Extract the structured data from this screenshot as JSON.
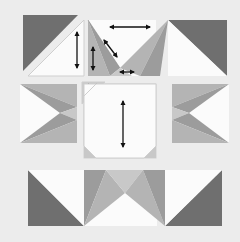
{
  "diagram": {
    "type": "quilt-block-puzzle",
    "colors": {
      "background": "#ececec",
      "dark": "#6f6f6f",
      "medium": "#9c9c9c",
      "medium_light": "#b4b4b4",
      "light": "#c8c8c8",
      "white": "#fbfbfb",
      "outline": "#cfcfcf",
      "arrow": "#111111"
    },
    "pieces": {
      "top_left": "half-square triangle (dark / white)",
      "top_middle": "flying geese unit with arrows",
      "top_right": "half-square triangle (dark / white)",
      "middle_left": "flying geese unit (rotated)",
      "center": "octagon square with corner triangles",
      "middle_right": "flying geese unit (rotated)",
      "bottom_left": "half-square triangle (dark / white)",
      "bottom_middle": "flying geese unit",
      "bottom_right": "half-square triangle (dark / white)"
    },
    "arrows": [
      {
        "id": "top-left-vertical",
        "direction": "vertical-double"
      },
      {
        "id": "top-middle-horizontal",
        "direction": "horizontal-double"
      },
      {
        "id": "top-middle-vertical",
        "direction": "vertical-double"
      },
      {
        "id": "top-middle-diagonal",
        "direction": "diagonal-double"
      },
      {
        "id": "top-middle-small-horizontal",
        "direction": "horizontal-double"
      },
      {
        "id": "center-small-horizontal",
        "direction": "horizontal-double"
      },
      {
        "id": "center-vertical",
        "direction": "vertical-double"
      }
    ]
  }
}
